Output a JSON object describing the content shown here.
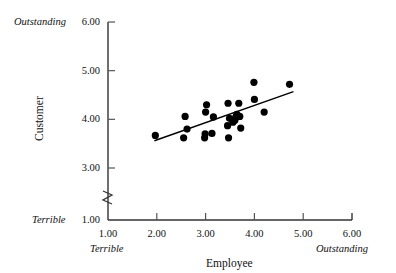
{
  "chart_data": {
    "type": "scatter",
    "title": "",
    "xlabel": "Employee",
    "ylabel": "Customer",
    "xlim": [
      1.0,
      6.0
    ],
    "ylim": [
      1.0,
      6.0
    ],
    "grid": false,
    "legend": "none",
    "y_axis_break": true,
    "y_axis_break_between": [
      1.0,
      3.0
    ],
    "x_ticks": [
      "1.00",
      "2.00",
      "3.00",
      "4.00",
      "5.00",
      "6.00"
    ],
    "x_tick_values": [
      1.0,
      2.0,
      3.0,
      4.0,
      5.0,
      6.0
    ],
    "y_ticks": [
      "1.00",
      "3.00",
      "4.00",
      "5.00",
      "6.00"
    ],
    "y_tick_values": [
      1.0,
      3.0,
      4.0,
      5.0,
      6.0
    ],
    "x_anchor_low": "Terrible",
    "x_anchor_high": "Outstanding",
    "y_anchor_low": "Terrible",
    "y_anchor_high": "Outstanding",
    "marker": "filled-circle",
    "marker_color": "#000000",
    "marker_size_px": 6,
    "points": [
      {
        "x": 1.97,
        "y": 3.67
      },
      {
        "x": 2.55,
        "y": 3.62
      },
      {
        "x": 2.58,
        "y": 4.06
      },
      {
        "x": 2.62,
        "y": 3.8
      },
      {
        "x": 2.98,
        "y": 3.62
      },
      {
        "x": 2.99,
        "y": 3.7
      },
      {
        "x": 3.0,
        "y": 4.15
      },
      {
        "x": 3.02,
        "y": 4.3
      },
      {
        "x": 3.13,
        "y": 3.71
      },
      {
        "x": 3.16,
        "y": 4.05
      },
      {
        "x": 3.45,
        "y": 3.87
      },
      {
        "x": 3.46,
        "y": 4.33
      },
      {
        "x": 3.47,
        "y": 3.62
      },
      {
        "x": 3.49,
        "y": 4.02
      },
      {
        "x": 3.56,
        "y": 3.94
      },
      {
        "x": 3.6,
        "y": 3.98
      },
      {
        "x": 3.62,
        "y": 4.05
      },
      {
        "x": 3.64,
        "y": 4.1
      },
      {
        "x": 3.68,
        "y": 4.33
      },
      {
        "x": 3.7,
        "y": 4.06
      },
      {
        "x": 3.72,
        "y": 3.82
      },
      {
        "x": 3.99,
        "y": 4.76
      },
      {
        "x": 4.0,
        "y": 4.41
      },
      {
        "x": 4.2,
        "y": 4.15
      },
      {
        "x": 4.72,
        "y": 4.72
      }
    ],
    "trend_line": {
      "type": "linear-fit",
      "x_start": 1.95,
      "y_start": 3.56,
      "x_end": 4.8,
      "y_end": 4.57,
      "color": "#000000"
    }
  }
}
